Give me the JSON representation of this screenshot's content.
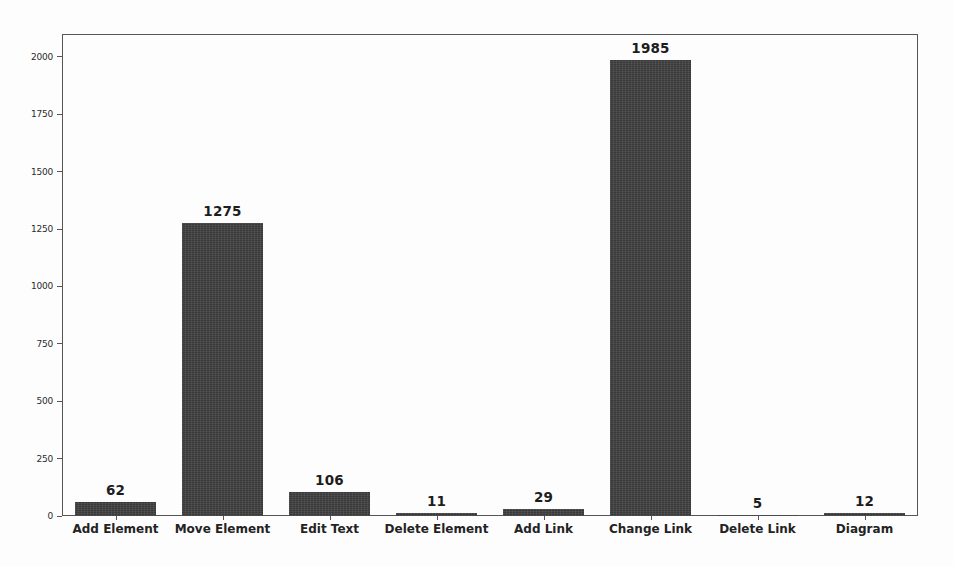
{
  "chart_data": {
    "type": "bar",
    "title": "",
    "xlabel": "",
    "ylabel": "",
    "categories": [
      "Add Element",
      "Move Element",
      "Edit Text",
      "Delete Element",
      "Add Link",
      "Change Link",
      "Delete Link",
      "Diagram"
    ],
    "values": [
      62,
      1275,
      106,
      11,
      29,
      1985,
      5,
      12
    ],
    "value_labels": [
      "62",
      "1275",
      "106",
      "11",
      "29",
      "1985",
      "5",
      "12"
    ],
    "ylim": [
      0,
      2100
    ],
    "yticks": [
      0,
      250,
      500,
      750,
      1000,
      1250,
      1500,
      1750,
      2000
    ],
    "ytick_labels": [
      "0",
      "250",
      "500",
      "750",
      "1000",
      "1250",
      "1500",
      "1750",
      "2000"
    ],
    "grid": false,
    "legend": null,
    "bar_color": "#3f3f3f",
    "background_color": "#fdfdfd",
    "axis_color": "#565656"
  }
}
